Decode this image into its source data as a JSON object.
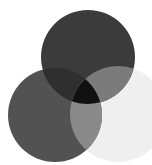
{
  "diagram": {
    "type": "venn-3",
    "circles": [
      {
        "id": "top",
        "cx": 88,
        "cy": 57,
        "r": 47,
        "color": "#3b3b3b"
      },
      {
        "id": "left",
        "cx": 55,
        "cy": 115,
        "r": 47,
        "color": "#525252"
      },
      {
        "id": "right",
        "cx": 118,
        "cy": 114,
        "r": 48,
        "color": "#efefef"
      }
    ],
    "regions": {
      "top_left": "#2f2f2f",
      "top_right": "#7b7b7b",
      "left_right": "#8a8a8a",
      "all": "#111111"
    },
    "background": "#ffffff"
  }
}
